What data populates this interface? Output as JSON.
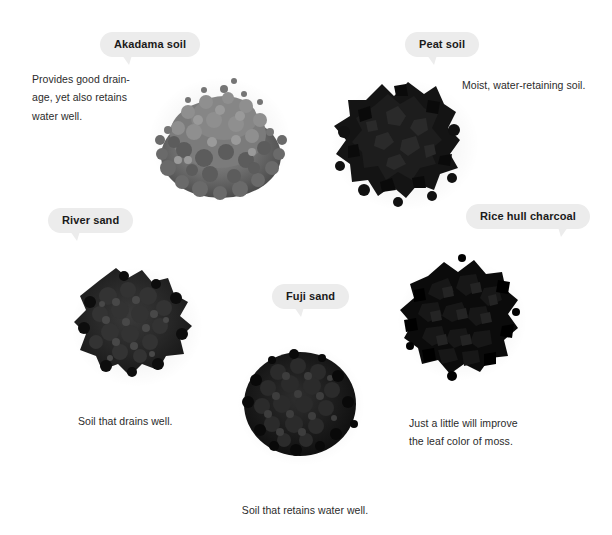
{
  "page": {
    "background_color": "#ffffff",
    "bubble_color": "#ececec",
    "text_color": "#2b2b2b",
    "label_color": "#1a1a1a"
  },
  "items": [
    {
      "id": "akadama",
      "label": "Akadama soil",
      "description": "Provides good drain-\nage, yet also retains\nwater well.",
      "pile_name": "akadama-soil-pile",
      "tone": "medium-gray granular"
    },
    {
      "id": "peat",
      "label": "Peat soil",
      "description": "Moist, water-retaining soil.",
      "pile_name": "peat-soil-pile",
      "tone": "very dark chunky"
    },
    {
      "id": "river-sand",
      "label": "River sand",
      "description": "Soil that drains well.",
      "pile_name": "river-sand-pile",
      "tone": "dark fine grained"
    },
    {
      "id": "rice-hull-charcoal",
      "label": "Rice hull charcoal",
      "description": "Just a little will improve\nthe leaf color of moss.",
      "pile_name": "rice-hull-charcoal-pile",
      "tone": "black angular flakes"
    },
    {
      "id": "fuji-sand",
      "label": "Fuji sand",
      "description": "Soil that retains water well.",
      "pile_name": "fuji-sand-pile",
      "tone": "black coarse grains"
    }
  ]
}
